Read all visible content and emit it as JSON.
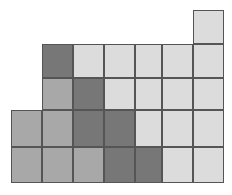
{
  "figure": {
    "title": "",
    "type": "grid-of-shaded-squares",
    "background": "#ffffff",
    "border_color": "#555555",
    "border_width": 1,
    "canvas": {
      "width": 232,
      "height": 195
    },
    "palette": {
      "light": "#dcdcdc",
      "medium": "#a8a8a8",
      "dark": "#777777"
    },
    "column_edges": [
      11,
      42,
      73,
      104,
      135,
      162,
      193,
      224
    ],
    "row_edges": [
      10,
      44,
      78,
      110,
      147,
      183
    ],
    "counts": {
      "total_cells": 26,
      "light": 14,
      "medium": 7,
      "dark": 7
    },
    "cells": [
      {
        "row": 1,
        "col": 7,
        "x": 193,
        "y": 10,
        "w": 31,
        "h": 34,
        "shade": "light",
        "color": "#dcdcdc"
      },
      {
        "row": 2,
        "col": 2,
        "x": 42,
        "y": 44,
        "w": 31,
        "h": 34,
        "shade": "dark",
        "color": "#777777"
      },
      {
        "row": 2,
        "col": 3,
        "x": 73,
        "y": 44,
        "w": 31,
        "h": 34,
        "shade": "light",
        "color": "#dcdcdc"
      },
      {
        "row": 2,
        "col": 4,
        "x": 104,
        "y": 44,
        "w": 31,
        "h": 34,
        "shade": "light",
        "color": "#dcdcdc"
      },
      {
        "row": 2,
        "col": 5,
        "x": 135,
        "y": 44,
        "w": 27,
        "h": 34,
        "shade": "light",
        "color": "#dcdcdc"
      },
      {
        "row": 2,
        "col": 6,
        "x": 162,
        "y": 44,
        "w": 31,
        "h": 34,
        "shade": "light",
        "color": "#dcdcdc"
      },
      {
        "row": 2,
        "col": 7,
        "x": 193,
        "y": 44,
        "w": 31,
        "h": 34,
        "shade": "light",
        "color": "#dcdcdc"
      },
      {
        "row": 3,
        "col": 2,
        "x": 42,
        "y": 78,
        "w": 31,
        "h": 32,
        "shade": "medium",
        "color": "#a8a8a8"
      },
      {
        "row": 3,
        "col": 3,
        "x": 73,
        "y": 78,
        "w": 31,
        "h": 32,
        "shade": "dark",
        "color": "#777777"
      },
      {
        "row": 3,
        "col": 4,
        "x": 104,
        "y": 78,
        "w": 31,
        "h": 32,
        "shade": "light",
        "color": "#dcdcdc"
      },
      {
        "row": 3,
        "col": 5,
        "x": 135,
        "y": 78,
        "w": 27,
        "h": 32,
        "shade": "light",
        "color": "#dcdcdc"
      },
      {
        "row": 3,
        "col": 6,
        "x": 162,
        "y": 78,
        "w": 31,
        "h": 32,
        "shade": "light",
        "color": "#dcdcdc"
      },
      {
        "row": 3,
        "col": 7,
        "x": 193,
        "y": 78,
        "w": 31,
        "h": 32,
        "shade": "light",
        "color": "#dcdcdc"
      },
      {
        "row": 4,
        "col": 1,
        "x": 11,
        "y": 110,
        "w": 31,
        "h": 37,
        "shade": "medium",
        "color": "#a8a8a8"
      },
      {
        "row": 4,
        "col": 2,
        "x": 42,
        "y": 110,
        "w": 31,
        "h": 37,
        "shade": "medium",
        "color": "#a8a8a8"
      },
      {
        "row": 4,
        "col": 3,
        "x": 73,
        "y": 110,
        "w": 31,
        "h": 37,
        "shade": "dark",
        "color": "#777777"
      },
      {
        "row": 4,
        "col": 4,
        "x": 104,
        "y": 110,
        "w": 31,
        "h": 37,
        "shade": "dark",
        "color": "#777777"
      },
      {
        "row": 4,
        "col": 5,
        "x": 135,
        "y": 110,
        "w": 27,
        "h": 37,
        "shade": "light",
        "color": "#dcdcdc"
      },
      {
        "row": 4,
        "col": 6,
        "x": 162,
        "y": 110,
        "w": 31,
        "h": 37,
        "shade": "light",
        "color": "#dcdcdc"
      },
      {
        "row": 4,
        "col": 7,
        "x": 193,
        "y": 110,
        "w": 31,
        "h": 37,
        "shade": "light",
        "color": "#dcdcdc"
      },
      {
        "row": 5,
        "col": 1,
        "x": 11,
        "y": 147,
        "w": 31,
        "h": 36,
        "shade": "medium",
        "color": "#a8a8a8"
      },
      {
        "row": 5,
        "col": 2,
        "x": 42,
        "y": 147,
        "w": 31,
        "h": 36,
        "shade": "medium",
        "color": "#a8a8a8"
      },
      {
        "row": 5,
        "col": 3,
        "x": 73,
        "y": 147,
        "w": 31,
        "h": 36,
        "shade": "medium",
        "color": "#a8a8a8"
      },
      {
        "row": 5,
        "col": 4,
        "x": 104,
        "y": 147,
        "w": 31,
        "h": 36,
        "shade": "dark",
        "color": "#777777"
      },
      {
        "row": 5,
        "col": 5,
        "x": 135,
        "y": 147,
        "w": 27,
        "h": 36,
        "shade": "dark",
        "color": "#777777"
      },
      {
        "row": 5,
        "col": 6,
        "x": 162,
        "y": 147,
        "w": 31,
        "h": 36,
        "shade": "light",
        "color": "#dcdcdc"
      },
      {
        "row": 5,
        "col": 7,
        "x": 193,
        "y": 147,
        "w": 31,
        "h": 36,
        "shade": "light",
        "color": "#dcdcdc"
      }
    ]
  }
}
